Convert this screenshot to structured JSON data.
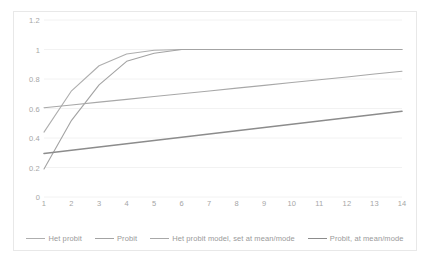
{
  "chart_data": {
    "type": "line",
    "title": "",
    "subtitle": "",
    "xlabel": "",
    "ylabel": "",
    "xlim": [
      1,
      14
    ],
    "ylim": [
      0,
      1.2
    ],
    "grid": true,
    "grid_axis": "y",
    "legend_position": "bottom",
    "x": [
      1,
      2,
      3,
      4,
      5,
      6,
      7,
      8,
      9,
      10,
      11,
      12,
      13,
      14
    ],
    "xticklabels": [
      "1",
      "2",
      "3",
      "4",
      "5",
      "6",
      "7",
      "8",
      "9",
      "10",
      "11",
      "12",
      "13",
      "14"
    ],
    "yticks": [
      0,
      0.2,
      0.4,
      0.6,
      0.8,
      1,
      1.2
    ],
    "yticklabels": [
      "0",
      "0.2",
      "0.4",
      "0.6",
      "0.8",
      "1",
      "1.2"
    ],
    "series": [
      {
        "name": "Het probit",
        "color": "#aeaeae",
        "width": 1.1,
        "values": [
          0.44,
          0.72,
          0.89,
          0.97,
          0.995,
          1.0,
          1.0,
          1.0,
          1.0,
          1.0,
          1.0,
          1.0,
          1.0,
          1.0
        ]
      },
      {
        "name": "Probit",
        "color": "#a3a3a3",
        "width": 1.1,
        "values": [
          0.19,
          0.52,
          0.76,
          0.92,
          0.975,
          1.0,
          1.0,
          1.0,
          1.0,
          1.0,
          1.0,
          1.0,
          1.0,
          1.0
        ]
      },
      {
        "name": "Het probit model, set at mean/mode",
        "color": "#a8a8a8",
        "width": 1.1,
        "values": [
          0.605,
          0.624,
          0.643,
          0.662,
          0.681,
          0.7,
          0.719,
          0.738,
          0.757,
          0.776,
          0.795,
          0.814,
          0.834,
          0.853
        ]
      },
      {
        "name": "Probit, at mean/mode",
        "color": "#8c8c8c",
        "width": 1.6,
        "values": [
          0.295,
          0.317,
          0.339,
          0.361,
          0.383,
          0.405,
          0.427,
          0.449,
          0.471,
          0.493,
          0.515,
          0.537,
          0.559,
          0.581
        ]
      }
    ]
  },
  "colors": {
    "plot_background": "#ffffff",
    "chart_border": "#e8e8e8",
    "gridline": "#f2f2f2",
    "tick_label": "#a6a6a6",
    "legend_label": "#9a9a9a"
  }
}
